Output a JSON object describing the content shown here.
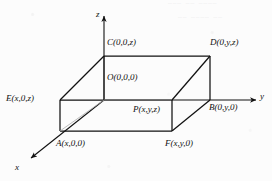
{
  "figure": {
    "type": "3d-coordinate-box-diagram",
    "background_color": "#fcfcfc",
    "line_color": "#111111",
    "axes": [
      {
        "name": "x",
        "label": "x",
        "label_x": 15,
        "label_y": 163,
        "arrow": "down-left"
      },
      {
        "name": "y",
        "label": "y",
        "label_x": 260,
        "label_y": 92,
        "arrow": "right"
      },
      {
        "name": "z",
        "label": "z",
        "label_x": 96,
        "label_y": 10,
        "arrow": "up"
      }
    ],
    "origin": {
      "x": 104,
      "y": 100
    },
    "vertices": {
      "O": {
        "label": "O(0,0,0)",
        "px": 104,
        "py": 100,
        "label_x": 107,
        "label_y": 73
      },
      "C": {
        "label": "C(0,0,z)",
        "px": 104,
        "py": 56,
        "label_x": 107,
        "label_y": 38
      },
      "D": {
        "label": "D(0,y,z)",
        "px": 210,
        "py": 56,
        "label_x": 210,
        "label_y": 38
      },
      "E": {
        "label": "E(x,0,z)",
        "px": 60,
        "py": 100,
        "label_x": 6,
        "label_y": 94
      },
      "B": {
        "label": "B(0,y,0)",
        "px": 210,
        "py": 100,
        "label_x": 209,
        "label_y": 103
      },
      "P": {
        "label": "P(x,y,z)",
        "px": 172,
        "py": 100,
        "label_x": 133,
        "label_y": 105
      },
      "A": {
        "label": "A(x,0,0)",
        "px": 60,
        "py": 131,
        "label_x": 56,
        "label_y": 139
      },
      "F": {
        "label": "F(x,y,0)",
        "px": 172,
        "py": 131,
        "label_x": 165,
        "label_y": 139
      }
    }
  }
}
